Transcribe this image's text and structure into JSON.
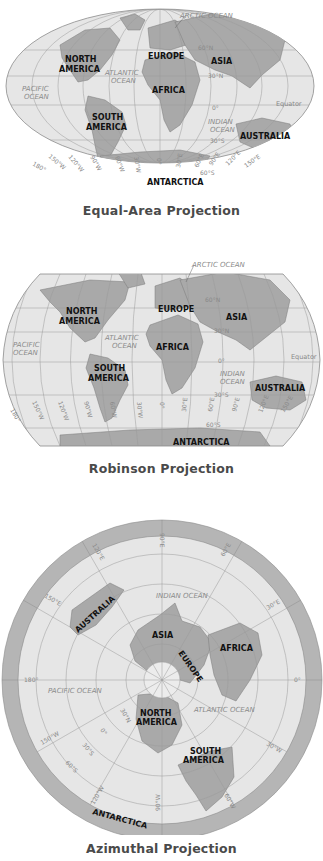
{
  "maps": [
    {
      "caption": "Equal-Area Projection",
      "labels": {
        "arctic": "ARCTIC OCEAN",
        "north_america_1": "NORTH",
        "north_america_2": "AMERICA",
        "europe": "EUROPE",
        "asia": "ASIA",
        "atlantic_1": "ATLANTIC",
        "atlantic_2": "OCEAN",
        "pacific_1": "PACIFIC",
        "pacific_2": "OCEAN",
        "africa": "AFRICA",
        "south_america_1": "SOUTH",
        "south_america_2": "AMERICA",
        "indian_1": "INDIAN",
        "indian_2": "OCEAN",
        "australia": "AUSTRALIA",
        "antarctica": "ANTARCTICA",
        "equator": "Equator",
        "lat_60n": "60°N",
        "lat_30n": "30°N",
        "lat_0": "0°",
        "lat_30s": "30°S",
        "lat_60s": "60°S",
        "lon_180": "180°",
        "lon_150w": "150°W",
        "lon_120w": "120°W",
        "lon_90w": "90°W",
        "lon_60w": "60°W",
        "lon_30w": "30°W",
        "lon_0": "0°",
        "lon_30e": "30°E",
        "lon_60e": "60°E",
        "lon_90e": "90°E",
        "lon_120e": "120°E",
        "lon_150e": "150°E"
      }
    },
    {
      "caption": "Robinson Projection",
      "labels": {
        "arctic": "ARCTIC OCEAN",
        "north_america_1": "NORTH",
        "north_america_2": "AMERICA",
        "europe": "EUROPE",
        "asia": "ASIA",
        "atlantic_1": "ATLANTIC",
        "atlantic_2": "OCEAN",
        "pacific_1": "PACIFIC",
        "pacific_2": "OCEAN",
        "africa": "AFRICA",
        "south_america_1": "SOUTH",
        "south_america_2": "AMERICA",
        "indian_1": "INDIAN",
        "indian_2": "OCEAN",
        "australia": "AUSTRALIA",
        "antarctica": "ANTARCTICA",
        "equator": "Equator",
        "lat_60n": "60°N",
        "lat_30n": "30°N",
        "lat_0": "0°",
        "lat_30s": "30°S",
        "lat_60s": "60°S",
        "lon_180": "180°",
        "lon_150w": "150°W",
        "lon_120w": "120°W",
        "lon_90w": "90°W",
        "lon_60w": "60°W",
        "lon_30w": "30°W",
        "lon_0": "0°",
        "lon_30e": "30°E",
        "lon_60e": "60°E",
        "lon_90e": "90°E",
        "lon_120e": "120°E",
        "lon_150e": "150°E"
      }
    },
    {
      "caption": "Azimuthal Projection",
      "labels": {
        "indian": "INDIAN OCEAN",
        "australia": "AUSTRALIA",
        "asia": "ASIA",
        "europe": "EUROPE",
        "africa": "AFRICA",
        "pacific": "PACIFIC OCEAN",
        "atlantic": "ATLANTIC OCEAN",
        "north_america_1": "NORTH",
        "north_america_2": "AMERICA",
        "south_america_1": "SOUTH",
        "south_america_2": "AMERICA",
        "antarctica": "ANTARCTICA",
        "lon_90e": "90°E",
        "lon_60e": "60°E",
        "lon_30e": "30°E",
        "lon_120e": "120°E",
        "lon_150e": "150°E",
        "lon_180": "180°",
        "lon_0": "0°",
        "lon_150w": "150°W",
        "lon_120w": "120°W",
        "lon_90w": "90°W",
        "lon_60w": "60°W",
        "lon_30w": "30°W",
        "lat_30n": "30°N",
        "lat_0": "0°",
        "lat_30s": "30°S",
        "lat_60s": "60°S"
      }
    }
  ],
  "colors": {
    "ocean": "#e6e6e6",
    "land": "#a9a9a9",
    "land_dark": "#959595",
    "grid": "#9a9a9a",
    "rim": "#b5b5b5",
    "caption": "#4a4a4a"
  }
}
